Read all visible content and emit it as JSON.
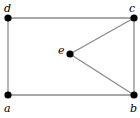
{
  "graph": {
    "vertices": [
      {
        "id": "d",
        "label": "d"
      },
      {
        "id": "c",
        "label": "c"
      },
      {
        "id": "e",
        "label": "e"
      },
      {
        "id": "a",
        "label": "a"
      },
      {
        "id": "b",
        "label": "b"
      }
    ],
    "edges": [
      {
        "from": "d",
        "to": "c"
      },
      {
        "from": "d",
        "to": "a"
      },
      {
        "from": "a",
        "to": "b"
      },
      {
        "from": "c",
        "to": "b"
      },
      {
        "from": "c",
        "to": "e"
      },
      {
        "from": "e",
        "to": "b"
      }
    ],
    "colors": {
      "edge": "#8a8a8a",
      "vertex": "#000000",
      "label": "#000000"
    }
  }
}
